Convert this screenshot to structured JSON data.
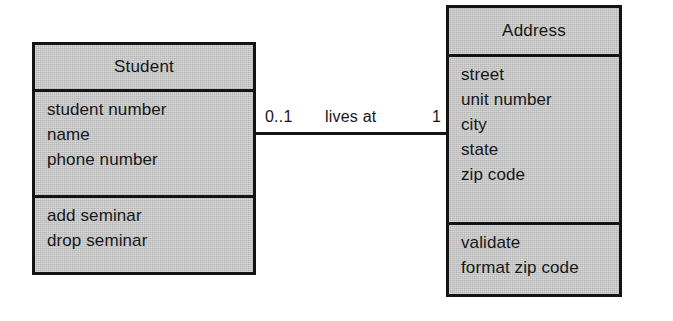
{
  "diagram": {
    "type": "uml-class-diagram",
    "background_color": "#ffffff",
    "box_fill_color": "#c9c9c9",
    "border_color": "#141414",
    "text_color": "#171717",
    "classes": [
      {
        "id": "student",
        "name": "Student",
        "attributes": [
          "student number",
          "name",
          "phone number"
        ],
        "operations": [
          "add seminar",
          "drop seminar"
        ]
      },
      {
        "id": "address",
        "name": "Address",
        "attributes": [
          "street",
          "unit number",
          "city",
          "state",
          "zip code"
        ],
        "operations": [
          "validate",
          "format zip code"
        ]
      }
    ],
    "association": {
      "name": "lives at",
      "source_multiplicity": "0..1",
      "target_multiplicity": "1"
    }
  }
}
